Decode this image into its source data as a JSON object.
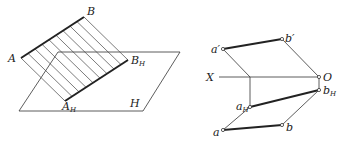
{
  "left_figure": {
    "description": "Spatial view of line AB and its projection onto plane H",
    "labels": {
      "A": "A",
      "B": "B",
      "B_H_main": "B",
      "B_H_sub": "H",
      "A_H_main": "A",
      "A_H_sub": "H",
      "plane": "H"
    }
  },
  "right_figure": {
    "description": "Orthographic projection of line AB with axis X-O",
    "labels": {
      "a_prime": "a′",
      "b_prime": "b′",
      "X": "X",
      "O": "O",
      "a_H_main": "a",
      "a_H_sub": "H",
      "b_H_main": "b",
      "b_H_sub": "H",
      "a": "a",
      "b": "b"
    }
  }
}
